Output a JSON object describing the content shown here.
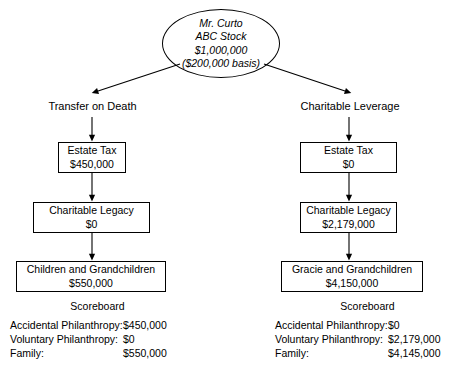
{
  "source": {
    "name": "Mr. Curto",
    "asset": "ABC Stock",
    "value": "$1,000,000",
    "basis": "($200,000 basis)"
  },
  "branches": [
    {
      "id": "transfer-on-death",
      "label": "Transfer on Death",
      "nodes": [
        {
          "title": "Estate Tax",
          "value": "$450,000"
        },
        {
          "title": "Charitable Legacy",
          "value": "$0"
        },
        {
          "title": "Children and Grandchildren",
          "value": "$550,000"
        }
      ],
      "scoreboard": {
        "title": "Scoreboard",
        "rows": [
          {
            "label": "Accidental Philanthropy:",
            "amount": "$450,000"
          },
          {
            "label": "Voluntary Philanthropy:",
            "amount": "$0"
          },
          {
            "label": "Family:",
            "amount": "$550,000"
          }
        ]
      }
    },
    {
      "id": "charitable-leverage",
      "label": "Charitable Leverage",
      "nodes": [
        {
          "title": "Estate Tax",
          "value": "$0"
        },
        {
          "title": "Charitable Legacy",
          "value": "$2,179,000"
        },
        {
          "title": "Gracie and Grandchildren",
          "value": "$4,150,000"
        }
      ],
      "scoreboard": {
        "title": "Scoreboard",
        "rows": [
          {
            "label": "Accidental Philanthropy:",
            "amount": "$0"
          },
          {
            "label": "Voluntary Philanthropy:",
            "amount": "$2,179,000"
          },
          {
            "label": "Family:",
            "amount": "$4,145,000"
          }
        ]
      }
    }
  ],
  "style": {
    "stroke": "#000000",
    "background": "#ffffff"
  }
}
